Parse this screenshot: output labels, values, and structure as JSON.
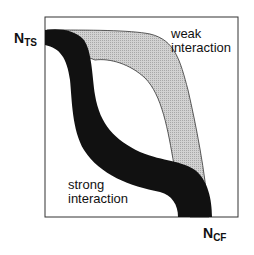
{
  "diagram": {
    "y_axis_label": {
      "main": "N",
      "sub": "TS"
    },
    "x_axis_label": {
      "main": "N",
      "sub": "CF"
    },
    "bands": [
      {
        "name": "weak",
        "label_line1": "weak",
        "label_line2": "interaction",
        "fill": "#c8c8c8",
        "stroke": "#333333"
      },
      {
        "name": "strong",
        "label_line1": "strong",
        "label_line2": "interaction",
        "fill": "#111111"
      }
    ],
    "frame_color": "#333333"
  }
}
